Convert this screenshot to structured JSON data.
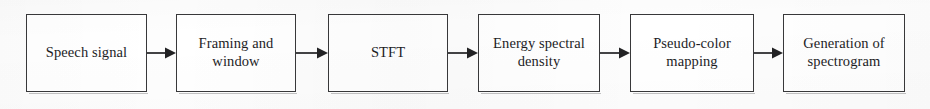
{
  "diagram": {
    "orientation": "left-to-right",
    "background_color": "#fdfdfd",
    "box_fill_color": "#ffffff",
    "box_border_color": "#38383a",
    "text_color": "#1d1d1f",
    "arrow_color": "#222224",
    "nodes": [
      {
        "id": "speech-signal",
        "label": "Speech signal",
        "x": 26,
        "y": 14,
        "w": 121,
        "h": 78
      },
      {
        "id": "framing-and-window",
        "label": "Framing and\nwindow",
        "x": 176,
        "y": 14,
        "w": 120,
        "h": 78
      },
      {
        "id": "stft",
        "label": "STFT",
        "x": 328,
        "y": 14,
        "w": 120,
        "h": 78
      },
      {
        "id": "energy-spectral-density",
        "label": "Energy spectral\ndensity",
        "x": 478,
        "y": 14,
        "w": 122,
        "h": 78
      },
      {
        "id": "pseudo-color-mapping",
        "label": "Pseudo-color\nmapping",
        "x": 630,
        "y": 14,
        "w": 124,
        "h": 78
      },
      {
        "id": "generation-of-spectrogram",
        "label": "Generation of\nspectrogram",
        "x": 783,
        "y": 14,
        "w": 122,
        "h": 78
      }
    ],
    "connectors": [
      {
        "id": "arrow-1",
        "from": "speech-signal",
        "to": "framing-and-window",
        "x": 147,
        "y": 47,
        "w": 29
      },
      {
        "id": "arrow-2",
        "from": "framing-and-window",
        "to": "stft",
        "x": 296,
        "y": 47,
        "w": 32
      },
      {
        "id": "arrow-3",
        "from": "stft",
        "to": "energy-spectral-density",
        "x": 448,
        "y": 47,
        "w": 30
      },
      {
        "id": "arrow-4",
        "from": "energy-spectral-density",
        "to": "pseudo-color-mapping",
        "x": 600,
        "y": 47,
        "w": 30
      },
      {
        "id": "arrow-5",
        "from": "pseudo-color-mapping",
        "to": "generation-of-spectrogram",
        "x": 754,
        "y": 47,
        "w": 29
      }
    ]
  }
}
